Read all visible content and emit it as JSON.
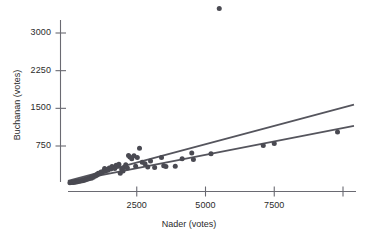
{
  "chart_data": {
    "type": "scatter",
    "title": "",
    "xlabel": "Nader (votes)",
    "ylabel": "Buchanan (votes)",
    "xlim": [
      0,
      10000
    ],
    "ylim": [
      0,
      3500
    ],
    "grid": false,
    "legend": "none",
    "xticks": [
      2500,
      5000,
      7500
    ],
    "xtick_labels": [
      "2500",
      "5000",
      "7500"
    ],
    "xticks_unlabeled": [
      10000
    ],
    "yticks": [
      750,
      1500,
      2250,
      3000
    ],
    "ytick_labels": [
      "750",
      "1500",
      "2250",
      "3000"
    ],
    "point_color": "#4a4a52",
    "line_color": "#55555d",
    "series": [
      {
        "name": "counties",
        "marker": "filled-circle",
        "points": [
          [
            70,
            18
          ],
          [
            110,
            25
          ],
          [
            150,
            30
          ],
          [
            190,
            22
          ],
          [
            230,
            36
          ],
          [
            270,
            30
          ],
          [
            310,
            45
          ],
          [
            350,
            38
          ],
          [
            400,
            55
          ],
          [
            440,
            48
          ],
          [
            490,
            62
          ],
          [
            530,
            58
          ],
          [
            560,
            78
          ],
          [
            600,
            70
          ],
          [
            640,
            90
          ],
          [
            680,
            82
          ],
          [
            720,
            105
          ],
          [
            760,
            96
          ],
          [
            800,
            118
          ],
          [
            850,
            110
          ],
          [
            880,
            140
          ],
          [
            920,
            130
          ],
          [
            960,
            160
          ],
          [
            1000,
            152
          ],
          [
            1040,
            185
          ],
          [
            1060,
            175
          ],
          [
            1100,
            205
          ],
          [
            1150,
            198
          ],
          [
            1200,
            230
          ],
          [
            1250,
            222
          ],
          [
            1300,
            255
          ],
          [
            1330,
            300
          ],
          [
            1360,
            248
          ],
          [
            1400,
            280
          ],
          [
            1450,
            268
          ],
          [
            1500,
            310
          ],
          [
            1560,
            292
          ],
          [
            1600,
            340
          ],
          [
            1660,
            322
          ],
          [
            1700,
            300
          ],
          [
            1750,
            365
          ],
          [
            1800,
            345
          ],
          [
            1850,
            385
          ],
          [
            1900,
            205
          ],
          [
            1950,
            290
          ],
          [
            2000,
            250
          ],
          [
            2060,
            330
          ],
          [
            2100,
            375
          ],
          [
            2160,
            310
          ],
          [
            2200,
            560
          ],
          [
            2250,
            530
          ],
          [
            2320,
            498
          ],
          [
            2400,
            555
          ],
          [
            2460,
            345
          ],
          [
            2520,
            520
          ],
          [
            2600,
            705
          ],
          [
            2700,
            425
          ],
          [
            2800,
            398
          ],
          [
            2900,
            330
          ],
          [
            3000,
            450
          ],
          [
            3150,
            320
          ],
          [
            3400,
            520
          ],
          [
            3480,
            355
          ],
          [
            3560,
            342
          ],
          [
            3900,
            345
          ],
          [
            4150,
            498
          ],
          [
            4500,
            610
          ],
          [
            4560,
            480
          ],
          [
            5200,
            595
          ],
          [
            5500,
            3490
          ],
          [
            7100,
            760
          ],
          [
            7500,
            800
          ],
          [
            9800,
            1030
          ]
        ]
      }
    ],
    "fit_lines": [
      {
        "name": "upper-regression-line",
        "x0": 0,
        "y0": 55,
        "x1": 10400,
        "y1": 1575
      },
      {
        "name": "lower-regression-line",
        "x0": 0,
        "y0": 40,
        "x1": 10400,
        "y1": 1150
      }
    ]
  },
  "axes": {
    "y_title": "Buchanan (votes)",
    "x_title": "Nader (votes)"
  }
}
